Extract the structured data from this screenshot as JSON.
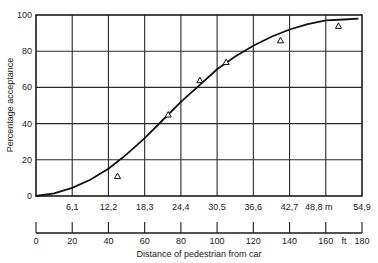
{
  "chart_data": {
    "type": "line",
    "title": "",
    "ylabel": "Percentage acceptance",
    "xlabel": "Distance of pedestrian from car",
    "ylim": [
      0,
      100
    ],
    "xlim_ft": [
      0,
      180
    ],
    "xlim_m": [
      0,
      54.9
    ],
    "grid": true,
    "y_ticks": [
      "0",
      "20",
      "40",
      "60",
      "80",
      "100"
    ],
    "x_ticks_m": [
      "6,1",
      "12,2",
      "18,3",
      "24,4",
      "30,5",
      "36,6",
      "42,7",
      "48,8 m",
      "54,9"
    ],
    "x_ticks_ft": [
      "0",
      "20",
      "40",
      "60",
      "80",
      "100",
      "120",
      "140",
      "160",
      "ft",
      "180"
    ],
    "ft_unit": "ft",
    "series": [
      {
        "name": "Fitted acceptance curve",
        "style": "line",
        "x_ft": [
          0,
          10,
          20,
          30,
          40,
          50,
          60,
          70,
          80,
          90,
          100,
          110,
          120,
          130,
          140,
          150,
          160,
          170,
          178
        ],
        "values": [
          0,
          1.5,
          4.5,
          9,
          15,
          23,
          32,
          42,
          52,
          61,
          70,
          77,
          83,
          88,
          92,
          95,
          97,
          97.5,
          98
        ]
      },
      {
        "name": "Observed data",
        "style": "triangle-markers",
        "x_ft": [
          45,
          73,
          90.5,
          105,
          135,
          167
        ],
        "values": [
          11,
          45,
          64,
          74,
          86,
          94
        ]
      }
    ]
  }
}
